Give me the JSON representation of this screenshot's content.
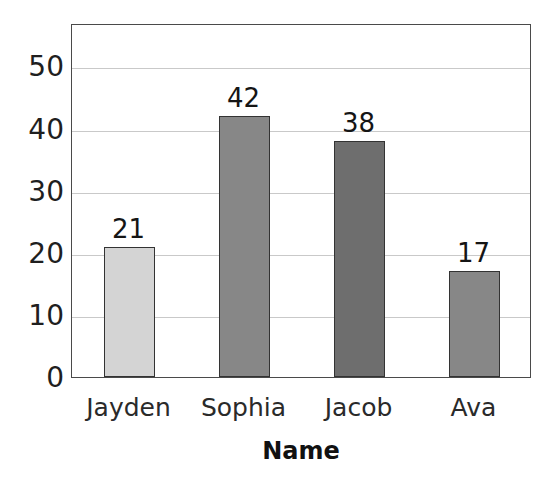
{
  "chart_data": {
    "type": "bar",
    "title": "Total Born: 840",
    "xlabel": "Name",
    "ylabel": "",
    "categories": [
      "Jayden",
      "Sophia",
      "Jacob",
      "Ava"
    ],
    "values": [
      21,
      42,
      38,
      17
    ],
    "value_labels": [
      "21",
      "42",
      "38",
      "17"
    ],
    "ytick_labels": [
      "50",
      "40",
      "30",
      "20",
      "10",
      "0"
    ],
    "yticks": [
      50,
      40,
      30,
      20,
      10,
      0
    ],
    "ylim": [
      0,
      57
    ],
    "grid": true,
    "legend": "none",
    "bar_colors": [
      "#d4d4d4",
      "#878787",
      "#6e6e6e",
      "#878787"
    ],
    "bar_edge_color": "#333333",
    "title_color": "#6b6b6b",
    "gridline_color": "#c9c9c9",
    "frame_color": "#4a4a4a",
    "background_color": "#ffffff"
  }
}
